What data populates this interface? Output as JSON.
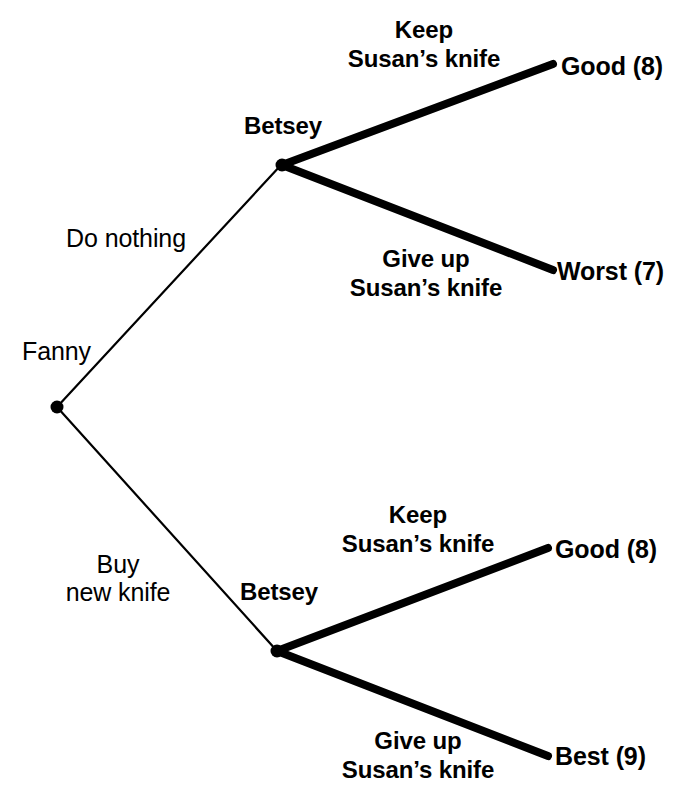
{
  "diagram": {
    "type": "game-tree",
    "title": "",
    "background_color": "#ffffff",
    "line_color": "#000000",
    "nodes": [
      {
        "id": "fanny",
        "player": "Fanny",
        "x": 57,
        "y": 407,
        "kind": "decision"
      },
      {
        "id": "betsey-top",
        "player": "Betsey",
        "x": 282,
        "y": 165,
        "kind": "decision"
      },
      {
        "id": "betsey-bottom",
        "player": "Betsey",
        "x": 277,
        "y": 651,
        "kind": "decision"
      }
    ],
    "edges": [
      {
        "from": "fanny",
        "to": "betsey-top",
        "action": "Do nothing",
        "style": "thin",
        "x1": 57,
        "y1": 407,
        "x2": 281,
        "y2": 165
      },
      {
        "from": "fanny",
        "to": "betsey-bottom",
        "action": "Buy\nnew knife",
        "style": "thin",
        "x1": 57,
        "y1": 407,
        "x2": 277,
        "y2": 651
      },
      {
        "from": "betsey-top",
        "to": "good-top",
        "action": "Keep\nSusan's knife",
        "style": "thick",
        "x1": 282,
        "y1": 165,
        "x2": 553,
        "y2": 64
      },
      {
        "from": "betsey-top",
        "to": "worst",
        "action": "Give up\nSusan's knife",
        "style": "thick",
        "x1": 282,
        "y1": 165,
        "x2": 553,
        "y2": 270
      },
      {
        "from": "betsey-bottom",
        "to": "good-bottom",
        "action": "Keep\nSusan's knife",
        "style": "thick",
        "x1": 277,
        "y1": 651,
        "x2": 548,
        "y2": 548
      },
      {
        "from": "betsey-bottom",
        "to": "best",
        "action": "Give up\nSusan's knife",
        "style": "thick",
        "x1": 277,
        "y1": 651,
        "x2": 548,
        "y2": 756
      }
    ],
    "outcomes": [
      {
        "id": "good-top",
        "label": "Good (8)",
        "rank": "Good",
        "payoff": 8,
        "x": 562,
        "y": 68
      },
      {
        "id": "worst",
        "label": "Worst (7)",
        "rank": "Worst",
        "payoff": 7,
        "x": 558,
        "y": 273
      },
      {
        "id": "good-bottom",
        "label": "Good (8)",
        "rank": "Good",
        "payoff": 8,
        "x": 556,
        "y": 551
      },
      {
        "id": "best",
        "label": "Best (9)",
        "rank": "Best",
        "payoff": 9,
        "x": 556,
        "y": 758
      }
    ]
  },
  "labels": {
    "player_fanny": "Fanny",
    "player_betsey_top": "Betsey",
    "player_betsey_bottom": "Betsey",
    "action_do_nothing": "Do nothing",
    "action_buy_line1": "Buy",
    "action_buy_line2": "new knife",
    "action_keep_top_line1": "Keep",
    "action_keep_top_line2": "Susan’s knife",
    "action_giveup_top_line1": "Give up",
    "action_giveup_top_line2": "Susan’s knife",
    "action_keep_bottom_line1": "Keep",
    "action_keep_bottom_line2": "Susan’s knife",
    "action_giveup_bottom_line1": "Give up",
    "action_giveup_bottom_line2": "Susan’s knife",
    "outcome_good_top": "Good (8)",
    "outcome_worst": "Worst (7)",
    "outcome_good_bottom": "Good (8)",
    "outcome_best": "Best (9)"
  }
}
